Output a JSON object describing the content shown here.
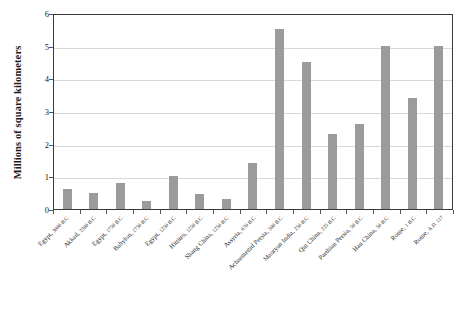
{
  "chart_data": {
    "type": "bar",
    "title": "",
    "xlabel": "",
    "ylabel": "Millions of square kilometers",
    "ylim": [
      0,
      6
    ],
    "ytick_values": [
      0,
      1,
      2,
      3,
      4,
      5,
      6
    ],
    "ytick_labels": [
      "0",
      "1",
      "2",
      "3",
      "4",
      "5",
      "6"
    ],
    "grid": true,
    "legend": "none",
    "bar_color": "#9b9b9b",
    "categories": [
      "Egypt, 3000 B.C.",
      "Akkad, 2300 B.C.",
      "Egypt, 1750 B.C.",
      "Babylon, 1750 B.C.",
      "Egypt, 1250 B.C.",
      "Hittites, 1250 B.C.",
      "Shang China, 1250 B.C.",
      "Assyria, 670 B.C.",
      "Achaemenid Persia, 500 B.C.",
      "Mauryan India, 250 B.C.",
      "Qin China, 225 B.C.",
      "Parthian Persia, 50 B.C.",
      "Han China, 50 B.C.",
      "Rome, 1 B.C.",
      "Rome, A.D. 117"
    ],
    "values": [
      0.6,
      0.5,
      0.8,
      0.25,
      1.0,
      0.45,
      0.3,
      1.4,
      5.5,
      4.5,
      2.3,
      2.6,
      5.0,
      3.4,
      5.0
    ]
  }
}
